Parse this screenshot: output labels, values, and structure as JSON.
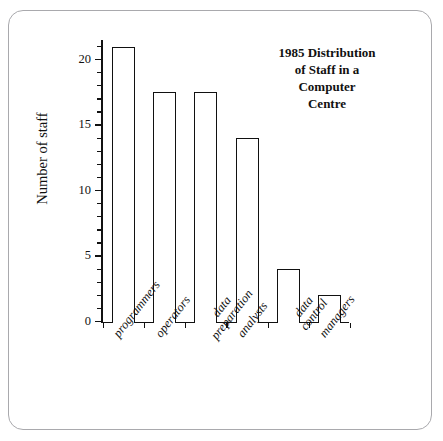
{
  "figure": {
    "frame_color": "#a9a9ad",
    "background": "#ffffff"
  },
  "chart_data": {
    "type": "bar",
    "title": "1985 Distribution of Staff in a Computer Centre",
    "title_lines": [
      "1985 Distribution",
      "of Staff in a",
      "Computer",
      "Centre"
    ],
    "xlabel": "",
    "ylabel": "Number of staff",
    "categories": [
      "programmers",
      "operators",
      "data preparation",
      "analysts",
      "data control",
      "managers"
    ],
    "category_lines": [
      [
        "programmers"
      ],
      [
        "operators"
      ],
      [
        "data",
        "preparation"
      ],
      [
        "analysts"
      ],
      [
        "data",
        "control"
      ],
      [
        "managers"
      ]
    ],
    "values": [
      21,
      17.5,
      17.5,
      14,
      4,
      2
    ],
    "ylim": [
      0,
      21.5
    ],
    "ytick_labels": [
      "0",
      "5",
      "10",
      "15",
      "20"
    ],
    "ytick_values": [
      0,
      5,
      10,
      15,
      20
    ],
    "minor_tick_step": 1,
    "grid": false,
    "legend": false,
    "bar_face_color": "#ffffff",
    "bar_edge_color": "#111111",
    "axis_color": "#111111"
  }
}
